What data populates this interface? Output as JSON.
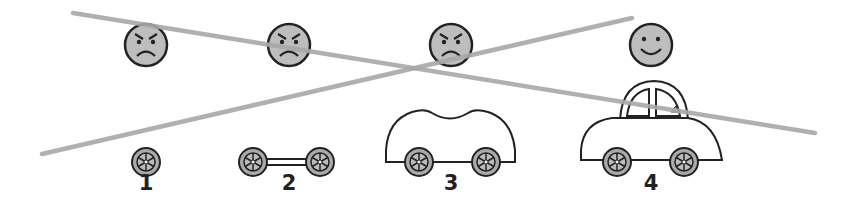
{
  "diagram": {
    "colors": {
      "line": "#a8a8a8",
      "face_fill": "#bdbdbd",
      "stroke": "#222222",
      "wheel_fill": "#aaaaaa"
    },
    "crossed_lines": [
      {
        "from": [
          73,
          13
        ],
        "to": [
          815,
          133
        ]
      },
      {
        "from": [
          42,
          154
        ],
        "to": [
          632,
          18
        ]
      }
    ],
    "stages": [
      {
        "label": "1",
        "x": 146,
        "face": "angry",
        "vehicle": "single-wheel"
      },
      {
        "label": "2",
        "x": 289,
        "face": "angry",
        "vehicle": "two-wheels-axle"
      },
      {
        "label": "3",
        "x": 451,
        "face": "angry",
        "vehicle": "car-body-no-roof"
      },
      {
        "label": "4",
        "x": 651,
        "face": "happy",
        "vehicle": "complete-car"
      }
    ]
  }
}
